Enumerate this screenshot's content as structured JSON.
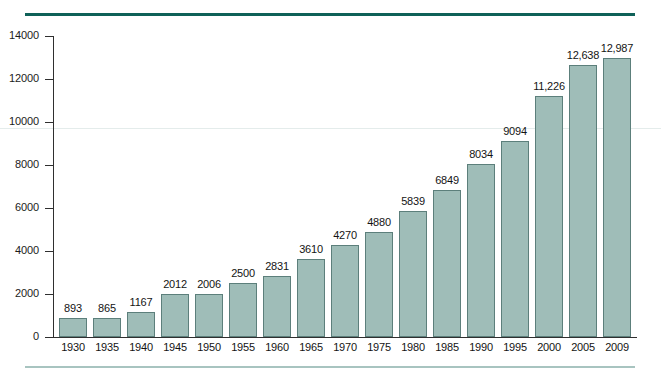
{
  "chart_data": {
    "type": "bar",
    "title": "",
    "subtitle": "",
    "xlabel": "",
    "ylabel": "",
    "categories": [
      "1930",
      "1935",
      "1940",
      "1945",
      "1950",
      "1955",
      "1960",
      "1965",
      "1970",
      "1975",
      "1980",
      "1985",
      "1990",
      "1995",
      "2000",
      "2005",
      "2009"
    ],
    "values": [
      893,
      865,
      1167,
      2012,
      2006,
      2500,
      2831,
      3610,
      4270,
      4880,
      5839,
      6849,
      8034,
      9094,
      11226,
      12638,
      12987
    ],
    "value_labels": [
      "893",
      "865",
      "1167",
      "2012",
      "2006",
      "2500",
      "2831",
      "3610",
      "4270",
      "4880",
      "5839",
      "6849",
      "8034",
      "9094",
      "11,226",
      "12,638",
      "12,987"
    ],
    "ylim": [
      0,
      14000
    ],
    "yticks": [
      0,
      2000,
      4000,
      6000,
      8000,
      10000,
      12000,
      14000
    ],
    "ytick_labels": [
      "0",
      "2000",
      "4000",
      "6000",
      "8000",
      "10000",
      "12000",
      "14000"
    ],
    "grid": false,
    "legend": null,
    "bar_color": "#9fbdb8",
    "bar_border_color": "#5c7f7b",
    "axis_color": "#2f2f2f",
    "top_rule_color": "#0f6158",
    "bottom_rule_color": "#a8c4c0",
    "background_color": "#ffffff"
  }
}
